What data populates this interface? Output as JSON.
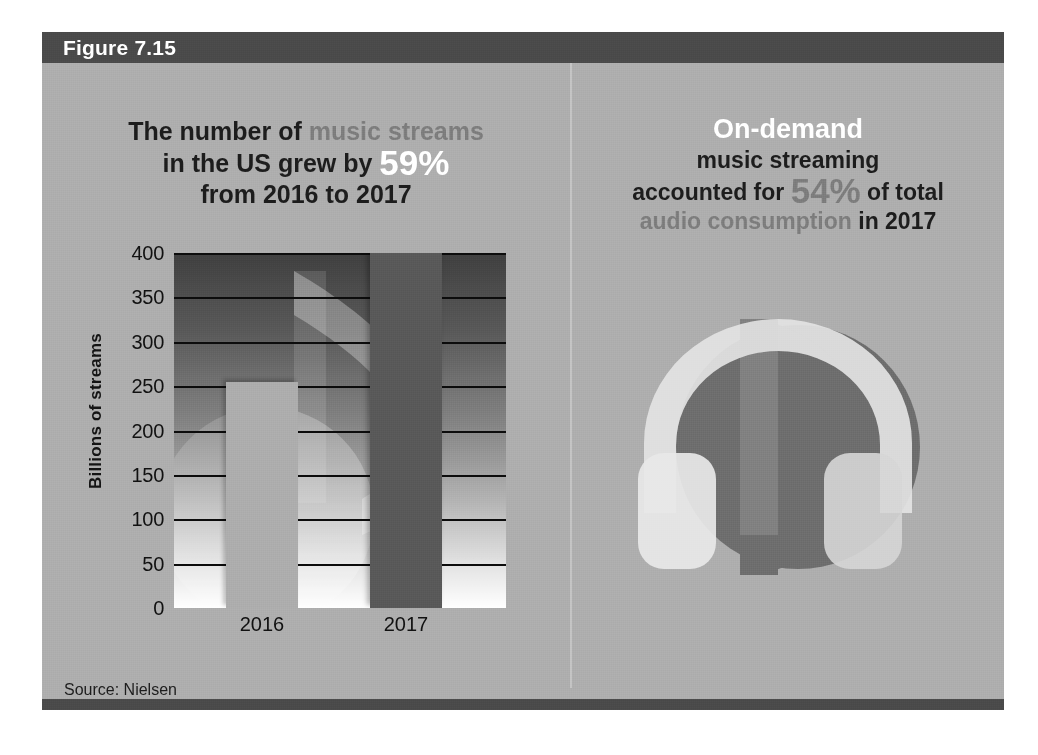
{
  "figure": {
    "label": "Figure 7.15",
    "header_color": "#4a4a4a",
    "panel_bg": "#aeaeae"
  },
  "left_panel": {
    "headline": {
      "line1_a": "The number of ",
      "line1_b": "music streams",
      "line2_a": "in the US grew by ",
      "line2_b": "59%",
      "line3": "from 2016 to 2017"
    },
    "source": "Source: Nielsen"
  },
  "right_panel": {
    "headline": {
      "line1": "On-demand",
      "line2": "music streaming",
      "line3_a": "accounted for ",
      "line3_b": "54%",
      "line3_c": " of total",
      "line4_a": "audio consumption",
      "line4_b": " in 2017"
    },
    "graphic_name": "headphones-music-note-illustration"
  },
  "chart_data": {
    "type": "bar",
    "title": "",
    "categories": [
      "2016",
      "2017"
    ],
    "values": [
      255,
      400
    ],
    "series": [
      {
        "name": "Billions of streams",
        "values": [
          255,
          400
        ]
      }
    ],
    "xlabel": "",
    "ylabel": "Billions of streams",
    "ylim": [
      0,
      400
    ],
    "yticks": [
      400,
      350,
      300,
      250,
      200,
      150,
      100,
      50,
      0
    ],
    "ytick_labels": [
      "400",
      "350",
      "300",
      "250",
      "200",
      "150",
      "100",
      "50",
      "0"
    ],
    "grid": true,
    "legend": false,
    "bar_colors": [
      "#adadad",
      "#595959"
    ],
    "source": "Source: Nielsen"
  },
  "colors": {
    "accent_grey": "#7d7d7d",
    "accent_white": "#ffffff",
    "text_dark": "#1d1d1d",
    "bar_2016": "#adadad",
    "bar_2017": "#595959",
    "header_bar": "#4a4a4a",
    "panel_background": "#aeaeae"
  }
}
